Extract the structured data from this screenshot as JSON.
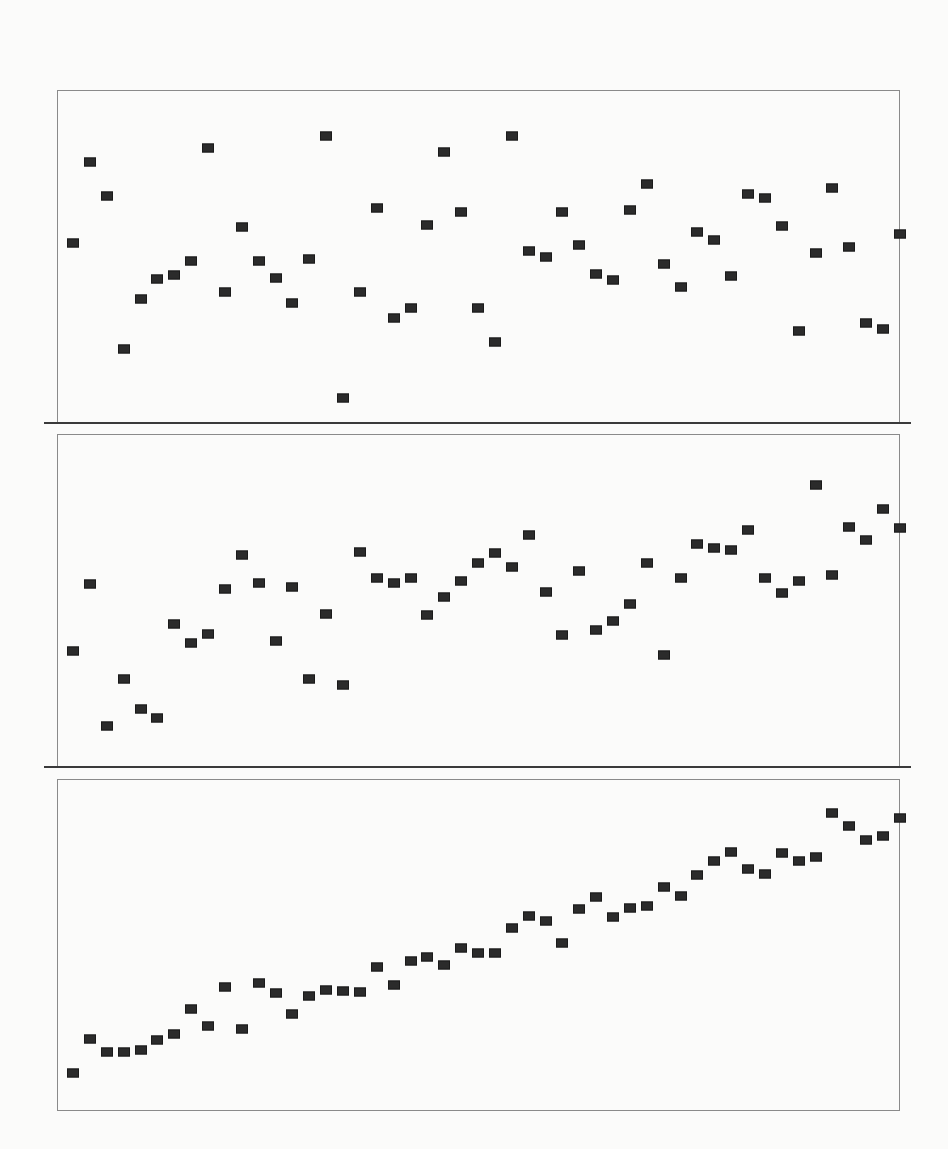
{
  "page": {
    "background": "#fbfbfa",
    "marker_color": "#2b2b2b",
    "frame_color": "#8a8a8a",
    "separator_color": "#3a3a3a"
  },
  "chart_data": [
    {
      "type": "scatter",
      "title": "",
      "xlabel": "",
      "ylabel": "",
      "grid": false,
      "legend": null,
      "marker": "square",
      "x": [
        1,
        2,
        3,
        4,
        5,
        6,
        7,
        8,
        9,
        10,
        11,
        12,
        13,
        14,
        15,
        16,
        17,
        18,
        19,
        20,
        21,
        22,
        23,
        24,
        25,
        26,
        27,
        28,
        29,
        30,
        31,
        32,
        33,
        34,
        35,
        36,
        37,
        38,
        39,
        40,
        41,
        42,
        43,
        44,
        45,
        46,
        47,
        48,
        49,
        50
      ],
      "y": [
        179,
        260,
        226,
        73,
        123,
        143,
        147,
        161,
        274,
        130,
        195,
        161,
        144,
        119,
        163,
        286,
        24,
        130,
        214,
        104,
        114,
        197,
        270,
        210,
        114,
        80,
        286,
        171,
        165,
        210,
        177,
        148,
        142,
        212,
        238,
        158,
        135,
        190,
        182,
        146,
        228,
        224,
        196,
        91,
        169,
        234,
        175,
        99,
        93,
        188
      ],
      "ylim": [
        0,
        332
      ],
      "xlim": [
        1,
        50
      ],
      "note": "y values are relative heights (px above panel bottom); no axis ticks shown"
    },
    {
      "type": "scatter",
      "title": "",
      "xlabel": "",
      "ylabel": "",
      "grid": false,
      "legend": null,
      "marker": "square",
      "x": [
        1,
        2,
        3,
        4,
        5,
        6,
        7,
        8,
        9,
        10,
        11,
        12,
        13,
        14,
        15,
        16,
        17,
        18,
        19,
        20,
        21,
        22,
        23,
        24,
        25,
        26,
        27,
        28,
        29,
        30,
        31,
        32,
        33,
        34,
        35,
        36,
        37,
        38,
        39,
        40,
        41,
        42,
        43,
        44,
        45,
        46,
        47,
        48,
        49,
        50
      ],
      "y": [
        115,
        182,
        40,
        87,
        57,
        48,
        142,
        123,
        132,
        177,
        211,
        183,
        125,
        179,
        87,
        152,
        81,
        214,
        188,
        183,
        188,
        151,
        169,
        185,
        203,
        213,
        199,
        231,
        174,
        131,
        195,
        136,
        145,
        162,
        203,
        111,
        188,
        222,
        218,
        216,
        236,
        188,
        173,
        185,
        281,
        191,
        239,
        226,
        257,
        238
      ],
      "ylim": [
        0,
        332
      ],
      "xlim": [
        1,
        50
      ],
      "note": "y values are relative heights (px above panel bottom); no axis ticks shown"
    },
    {
      "type": "scatter",
      "title": "",
      "xlabel": "",
      "ylabel": "",
      "grid": false,
      "legend": null,
      "marker": "square",
      "x": [
        1,
        2,
        3,
        4,
        5,
        6,
        7,
        8,
        9,
        10,
        11,
        12,
        13,
        14,
        15,
        16,
        17,
        18,
        19,
        20,
        21,
        22,
        23,
        24,
        25,
        26,
        27,
        28,
        29,
        30,
        31,
        32,
        33,
        34,
        35,
        36,
        37,
        38,
        39,
        40,
        41,
        42,
        43,
        44,
        45,
        46,
        47,
        48,
        49,
        50
      ],
      "y": [
        37,
        71,
        58,
        58,
        60,
        70,
        76,
        101,
        84,
        123,
        81,
        127,
        117,
        96,
        114,
        120,
        119,
        118,
        143,
        125,
        149,
        153,
        145,
        162,
        157,
        157,
        182,
        194,
        189,
        167,
        201,
        213,
        193,
        202,
        204,
        223,
        214,
        235,
        249,
        258,
        241,
        236,
        257,
        249,
        253,
        297,
        284,
        270,
        274,
        292
      ],
      "ylim": [
        0,
        332
      ],
      "xlim": [
        1,
        50
      ],
      "note": "y values are relative heights (px above panel bottom); no axis ticks shown"
    }
  ]
}
